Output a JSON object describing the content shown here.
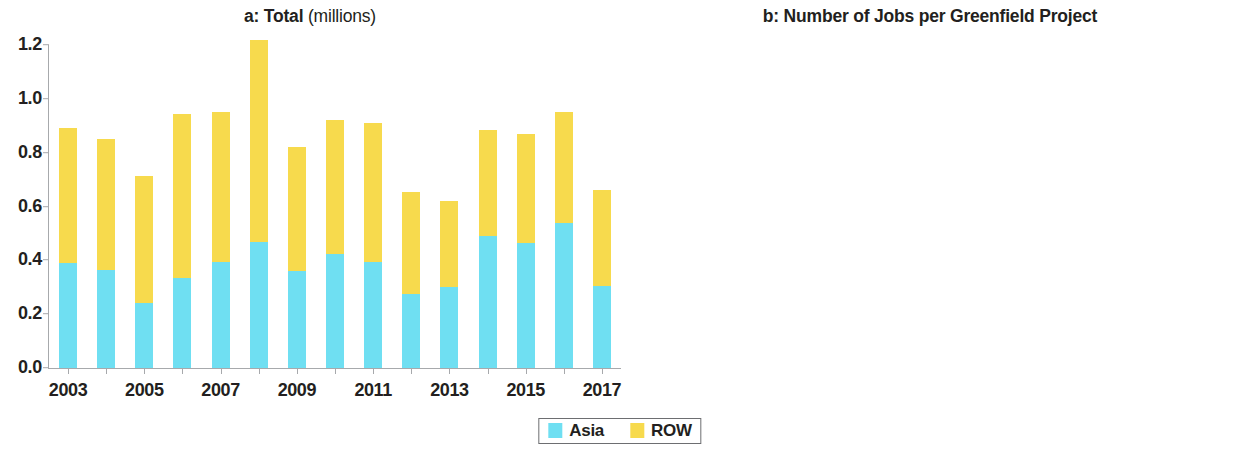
{
  "legend": {
    "items": [
      {
        "label": "Asia",
        "color": "#6fdff2",
        "key": "asia"
      },
      {
        "label": "ROW",
        "color": "#f7da4d",
        "key": "row"
      }
    ]
  },
  "chart_data": [
    {
      "panel": "a",
      "type": "bar",
      "stacked": true,
      "title_bold": "a: Total",
      "title_light": "(millions)",
      "title": "a: Total (millions)",
      "xlabel": "",
      "ylabel": "",
      "ylim": [
        0,
        1.2
      ],
      "yticks": [
        0.0,
        0.2,
        0.4,
        0.6,
        0.8,
        1.0,
        1.2
      ],
      "ytick_labels": [
        "0.0",
        "0.2",
        "0.4",
        "0.6",
        "0.8",
        "1.0",
        "1.2"
      ],
      "grid": false,
      "legend_position": "bottom-center",
      "categories": [
        2003,
        2004,
        2005,
        2006,
        2007,
        2008,
        2009,
        2010,
        2011,
        2012,
        2013,
        2014,
        2015,
        2016,
        2017
      ],
      "xtick_labels": [
        "2003",
        "2005",
        "2007",
        "2009",
        "2011",
        "2013",
        "2015",
        "2017"
      ],
      "xtick_values": [
        2003,
        2005,
        2007,
        2009,
        2011,
        2013,
        2015,
        2017
      ],
      "series": [
        {
          "name": "Asia",
          "color": "#6fdff2",
          "values": [
            0.39,
            0.365,
            0.24,
            0.335,
            0.395,
            0.47,
            0.36,
            0.425,
            0.395,
            0.275,
            0.3,
            0.49,
            0.465,
            0.54,
            0.305
          ]
        },
        {
          "name": "ROW",
          "color": "#f7da4d",
          "values": [
            0.5,
            0.485,
            0.475,
            0.61,
            0.555,
            0.75,
            0.46,
            0.495,
            0.515,
            0.38,
            0.32,
            0.395,
            0.405,
            0.41,
            0.355
          ]
        }
      ],
      "totals": [
        0.89,
        0.85,
        0.715,
        0.945,
        0.95,
        1.22,
        0.82,
        0.92,
        0.91,
        0.655,
        0.62,
        0.885,
        0.87,
        0.95,
        0.66
      ]
    },
    {
      "panel": "b",
      "type": "bar",
      "stacked": false,
      "grouped": true,
      "title_bold": "b: Number of Jobs per Greenfield Project",
      "title_light": "",
      "title": "b: Number of Jobs per Greenfield Project",
      "xlabel": "",
      "ylabel": "",
      "ylim": [
        0,
        400
      ],
      "yticks": [
        0,
        100,
        200,
        300,
        400
      ],
      "ytick_labels": [
        "0",
        "100",
        "200",
        "300",
        "400"
      ],
      "grid": false,
      "legend_position": "bottom-center",
      "categories": [
        2003,
        2004,
        2005,
        2006,
        2007,
        2008,
        2009,
        2010,
        2011,
        2012,
        2013,
        2014,
        2015,
        2016,
        2017
      ],
      "xtick_labels": [
        "2003",
        "2005",
        "2007",
        "2009",
        "2011",
        "2013",
        "2015",
        "2017"
      ],
      "xtick_values": [
        2003,
        2005,
        2007,
        2009,
        2011,
        2013,
        2015,
        2017
      ],
      "series": [
        {
          "name": "Asia",
          "color": "#6fdff2",
          "values": [
            318,
            302,
            271,
            304,
            383,
            288,
            284,
            313,
            277,
            225,
            224,
            340,
            325,
            382,
            276
          ]
        },
        {
          "name": "ROW",
          "color": "#f7da4d",
          "values": [
            255,
            211,
            213,
            231,
            211,
            216,
            160,
            166,
            156,
            133,
            112,
            140,
            161,
            157,
            143
          ]
        }
      ]
    }
  ]
}
